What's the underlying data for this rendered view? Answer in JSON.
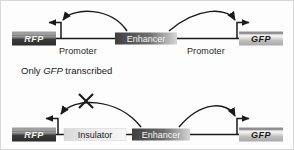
{
  "figure": {
    "caption_middle": "Only GFP transcribed",
    "caption_middle_parts": {
      "pre": "Only ",
      "italic": "GFP",
      "post": " transcribed"
    }
  },
  "colors": {
    "line": "#1a1a1a",
    "text": "#1b1b1b",
    "background": "#fdfdfd",
    "border": "#d8d8d8",
    "rfp_box_dark": "#3a3a3a",
    "rfp_box_light": "#c9c9c9",
    "gfp_box_dark": "#a8a8a8",
    "gfp_box_light": "#e4e4e4",
    "enhancer_dark": "#4a4a4a",
    "enhancer_light": "#d2d2d2",
    "insulator_dark": "#cfcfcf",
    "insulator_light": "#f2f2f2"
  },
  "panels": [
    {
      "id": "panel-top",
      "name": "enhancer-activates-both-genes",
      "elements": {
        "rfp_gene": "RFP",
        "gfp_gene": "GFP",
        "promoter_left": "Promoter",
        "promoter_right": "Promoter",
        "enhancer": "Enhancer"
      },
      "arcs": [
        {
          "name": "enhancer-to-left-promoter",
          "blocked": false
        },
        {
          "name": "enhancer-to-right-promoter",
          "blocked": false
        }
      ],
      "transcription": {
        "rfp": "active",
        "gfp": "active"
      }
    },
    {
      "id": "panel-bottom",
      "name": "insulator-blocks-left-enhancer-action",
      "elements": {
        "rfp_gene": "RFP",
        "gfp_gene": "GFP",
        "insulator": "Insulator",
        "enhancer": "Enhancer"
      },
      "arcs": [
        {
          "name": "enhancer-to-left-promoter",
          "blocked": true,
          "block_marker": "x-mark"
        },
        {
          "name": "enhancer-to-right-promoter",
          "blocked": false
        }
      ],
      "transcription": {
        "rfp": "blocked",
        "gfp": "active"
      }
    }
  ]
}
